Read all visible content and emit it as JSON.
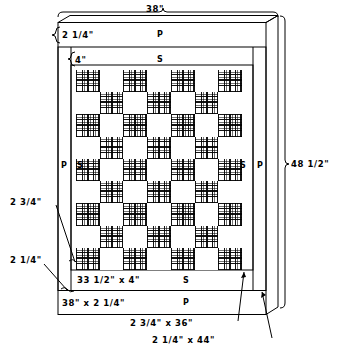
{
  "diagram": {
    "dimensions": {
      "overall_width": "38\"",
      "overall_height": "48 1/2\"",
      "top_border_p": "2 1/4\"",
      "top_border_s": "4\"",
      "left_callout_upper": "2 3/4\"",
      "left_callout_lower": "2 1/4\"",
      "bottom_band_s": "33 1/2\"  x  4\"",
      "bottom_band_p": "38\"  x  2 1/4\"",
      "side_strip_s": "2 3/4\"  x  36\"",
      "side_strip_p": "2 1/4\"  x  44\""
    },
    "fabric_codes": {
      "p": "P",
      "s": "S"
    },
    "band_letters": {
      "top_p": "P",
      "top_s": "S",
      "left_p": "P",
      "left_s": "S",
      "right_s": "S",
      "right_p": "P",
      "bottom_s": "S",
      "bottom_p": "P"
    }
  },
  "chart_data": {
    "type": "heatmap",
    "rows": 9,
    "cols": 7,
    "legend": [
      "plaid",
      "plain"
    ],
    "grid": [
      [
        "plaid",
        "plain",
        "plaid",
        "plain",
        "plaid",
        "plain",
        "plaid"
      ],
      [
        "plain",
        "plaid",
        "plain",
        "plaid",
        "plain",
        "plaid",
        "plain"
      ],
      [
        "plaid",
        "plain",
        "plaid",
        "plain",
        "plaid",
        "plain",
        "plaid"
      ],
      [
        "plain",
        "plaid",
        "plain",
        "plaid",
        "plain",
        "plaid",
        "plain"
      ],
      [
        "plaid",
        "plain",
        "plaid",
        "plain",
        "plaid",
        "plain",
        "plaid"
      ],
      [
        "plain",
        "plaid",
        "plain",
        "plaid",
        "plain",
        "plaid",
        "plain"
      ],
      [
        "plaid",
        "plain",
        "plaid",
        "plain",
        "plaid",
        "plain",
        "plaid"
      ],
      [
        "plain",
        "plaid",
        "plain",
        "plaid",
        "plain",
        "plaid",
        "plain"
      ],
      [
        "plaid",
        "plain",
        "plaid",
        "plain",
        "plaid",
        "plain",
        "plaid"
      ]
    ]
  }
}
